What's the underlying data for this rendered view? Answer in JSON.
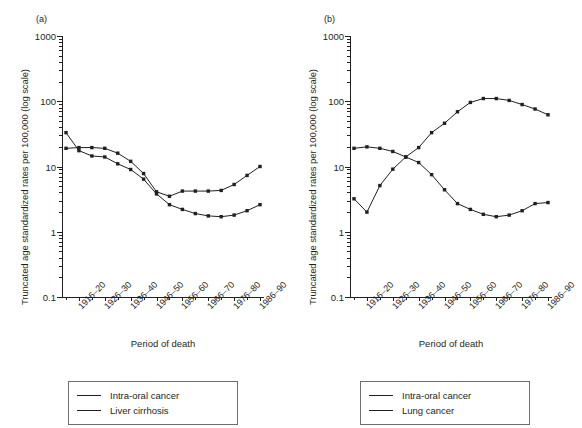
{
  "figure": {
    "panels": [
      {
        "tag": "(a)",
        "ylabel": "Truncated age standardized rates per 100,000 (log scale)",
        "xlabel": "Period of death",
        "legend": [
          {
            "label": "Intra-oral cancer",
            "color": "#231f20"
          },
          {
            "label": "Liver cirrhosis",
            "color": "#231f20"
          }
        ]
      },
      {
        "tag": "(b)",
        "ylabel": "Truncated age standardized rates per 100,000 (log scale)",
        "xlabel": "Period of death",
        "legend": [
          {
            "label": "Intra-oral cancer",
            "color": "#231f20"
          },
          {
            "label": "Lung cancer",
            "color": "#231f20"
          }
        ]
      }
    ]
  },
  "chart_data": [
    {
      "type": "line",
      "panel": "(a)",
      "title": "",
      "xlabel": "Period of death",
      "ylabel": "Truncated age standardized rates per 100,000 (log scale)",
      "yscale": "log",
      "ylim": [
        0.1,
        1000
      ],
      "ytick_labels": [
        "1000",
        "100",
        "10",
        "1",
        "0.1"
      ],
      "ytick_values": [
        1000,
        100,
        10,
        1,
        0.1
      ],
      "grid": false,
      "legend_position": "below",
      "x": [
        "1911-15",
        "1916-20",
        "1921-25",
        "1926-30",
        "1931-35",
        "1936-40",
        "1941-45",
        "1946-50",
        "1951-55",
        "1956-60",
        "1961-65",
        "1966-70",
        "1971-75",
        "1976-80",
        "1981-85",
        "1986-90"
      ],
      "xtick_labels": [
        "1916-20",
        "1926-30",
        "1936-40",
        "1946-50",
        "1956-60",
        "1966-70",
        "1976-80",
        "1986-90"
      ],
      "xtick_indices": [
        1,
        3,
        5,
        7,
        9,
        11,
        13,
        15
      ],
      "series": [
        {
          "name": "Intra-oral cancer",
          "color": "#231f20",
          "marker": "square",
          "values": [
            19.0,
            19.5,
            19.5,
            19.0,
            16.0,
            12.0,
            7.8,
            4.1,
            3.5,
            4.2,
            4.2,
            4.2,
            4.3,
            5.3,
            7.3,
            10.0
          ]
        },
        {
          "name": "Liver cirrhosis",
          "color": "#231f20",
          "marker": "square",
          "values": [
            33.0,
            17.5,
            14.5,
            14.0,
            11.0,
            9.0,
            6.4,
            3.8,
            2.6,
            2.2,
            1.9,
            1.75,
            1.7,
            1.8,
            2.1,
            2.6
          ]
        }
      ]
    },
    {
      "type": "line",
      "panel": "(b)",
      "title": "",
      "xlabel": "Period of death",
      "ylabel": "Truncated age standardized rates per 100,000 (log scale)",
      "yscale": "log",
      "ylim": [
        0.1,
        1000
      ],
      "ytick_labels": [
        "1000",
        "100",
        "10",
        "1",
        "0.1"
      ],
      "ytick_values": [
        1000,
        100,
        10,
        1,
        0.1
      ],
      "grid": false,
      "legend_position": "below",
      "x": [
        "1911-15",
        "1916-20",
        "1921-25",
        "1926-30",
        "1931-35",
        "1936-40",
        "1941-45",
        "1946-50",
        "1951-55",
        "1956-60",
        "1961-65",
        "1966-70",
        "1971-75",
        "1976-80",
        "1981-85",
        "1986-90"
      ],
      "xtick_labels": [
        "1916-20",
        "1926-30",
        "1936-40",
        "1946-50",
        "1956-60",
        "1966-70",
        "1976-80",
        "1986-90"
      ],
      "xtick_indices": [
        1,
        3,
        5,
        7,
        9,
        11,
        13,
        15
      ],
      "series": [
        {
          "name": "Intra-oral cancer",
          "color": "#231f20",
          "marker": "square",
          "values": [
            19.0,
            20.0,
            19.0,
            17.0,
            14.0,
            11.5,
            7.5,
            4.4,
            2.7,
            2.2,
            1.85,
            1.7,
            1.8,
            2.1,
            2.7,
            2.8
          ]
        },
        {
          "name": "Lung cancer",
          "color": "#231f20",
          "marker": "square",
          "values": [
            3.2,
            2.0,
            5.1,
            9.1,
            14.0,
            19.5,
            33.0,
            46.0,
            69.0,
            96.0,
            110.0,
            110.0,
            103.0,
            89.0,
            76.0,
            62.0
          ]
        }
      ]
    }
  ]
}
